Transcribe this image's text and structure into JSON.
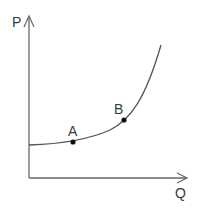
{
  "diagram": {
    "axes": {
      "y_label": "P",
      "x_label": "Q"
    },
    "points": [
      {
        "id": "A",
        "label": "A"
      },
      {
        "id": "B",
        "label": "B"
      }
    ],
    "curve": {
      "description": "upward-sloping, convex curve (flat at low Q, steep at high Q)"
    },
    "colors": {
      "line": "#555555",
      "point": "#111111",
      "text": "#3a3a3a",
      "background": "#ffffff"
    }
  }
}
